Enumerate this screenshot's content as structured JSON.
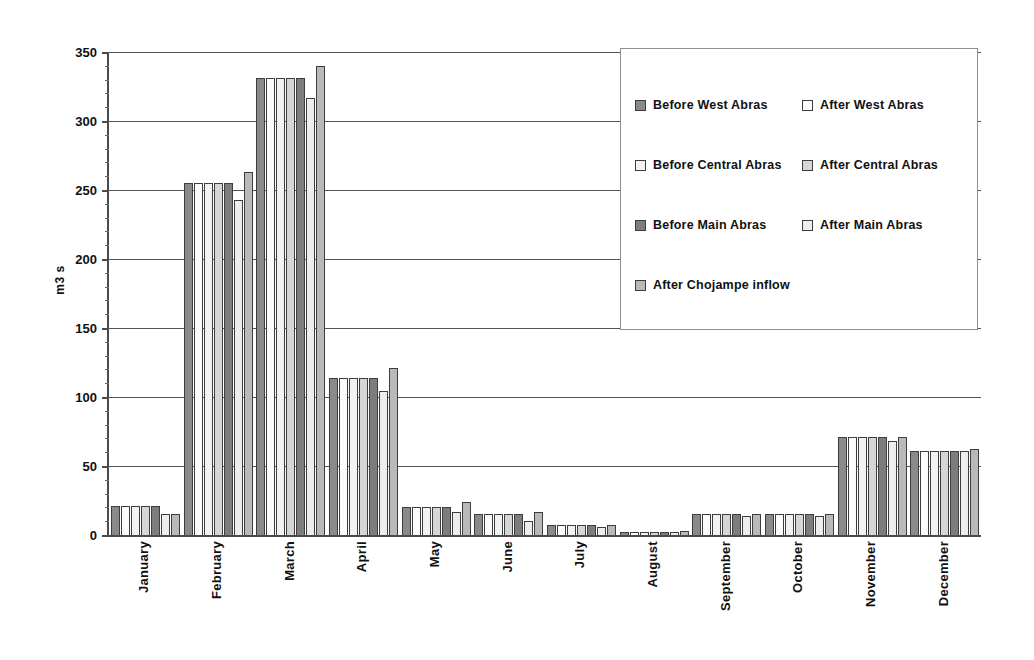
{
  "chart_data": {
    "type": "bar",
    "title": "",
    "xlabel": "",
    "ylabel": "m3 s",
    "ylim": [
      0,
      350
    ],
    "yticks": [
      0,
      50,
      100,
      150,
      200,
      250,
      300,
      350
    ],
    "grid": true,
    "legend_position": "top-right",
    "categories": [
      "January",
      "February",
      "March",
      "April",
      "May",
      "June",
      "July",
      "August",
      "September",
      "October",
      "November",
      "December"
    ],
    "series": [
      {
        "name": "Before West Abras",
        "color": "#8a8a8a",
        "values": [
          21,
          255,
          331,
          114,
          20,
          15,
          7,
          2,
          15,
          15,
          71,
          61
        ]
      },
      {
        "name": "After West Abras",
        "color": "#fbfbfb",
        "values": [
          21,
          255,
          331,
          114,
          20,
          15,
          7,
          2,
          15,
          15,
          71,
          61
        ]
      },
      {
        "name": "Before Central Abras",
        "color": "#f2f2f2",
        "values": [
          21,
          255,
          331,
          114,
          20,
          15,
          7,
          2,
          15,
          15,
          71,
          61
        ]
      },
      {
        "name": "After Central Abras",
        "color": "#d6d6d6",
        "values": [
          21,
          255,
          331,
          114,
          20,
          15,
          7,
          2,
          15,
          15,
          71,
          61
        ]
      },
      {
        "name": "Before Main Abras",
        "color": "#7d7d7d",
        "values": [
          21,
          255,
          331,
          114,
          20,
          15,
          7,
          2,
          15,
          15,
          71,
          61
        ]
      },
      {
        "name": "After Main Abras",
        "color": "#ededed",
        "values": [
          15,
          243,
          317,
          104,
          17,
          10,
          6,
          2,
          14,
          14,
          68,
          61
        ]
      },
      {
        "name": "After Chojampe inflow",
        "color": "#b9b9b9",
        "values": [
          15,
          263,
          340,
          121,
          24,
          17,
          7,
          3,
          15,
          15,
          71,
          62
        ]
      }
    ]
  },
  "legend": {
    "items": [
      {
        "label": "Before West Abras",
        "swatch_class": "s0"
      },
      {
        "label": "After West Abras",
        "swatch_class": "s1"
      },
      {
        "label": "Before Central Abras",
        "swatch_class": "s2"
      },
      {
        "label": "After Central Abras",
        "swatch_class": "s3"
      },
      {
        "label": "Before Main Abras",
        "swatch_class": "s4"
      },
      {
        "label": "After Main Abras",
        "swatch_class": "s5"
      },
      {
        "label": "After Chojampe inflow",
        "swatch_class": "s6"
      }
    ],
    "display_order": [
      0,
      1,
      2,
      3,
      4,
      5,
      6
    ]
  },
  "axis": {
    "y_title": "m3 s"
  }
}
